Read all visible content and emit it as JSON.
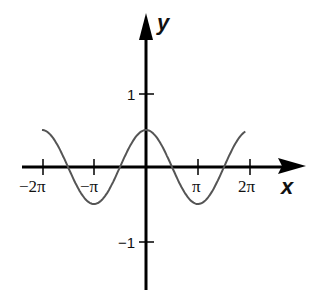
{
  "chart_data": {
    "type": "line",
    "title": "",
    "xlabel": "x",
    "ylabel": "y",
    "function": "y = 0.5·cos(x)",
    "x_ticks": [
      "−2π",
      "−π",
      "π",
      "2π"
    ],
    "x_tick_values": [
      -6.2832,
      -3.1416,
      3.1416,
      6.2832
    ],
    "y_ticks": [
      "1",
      "−1"
    ],
    "y_tick_values": [
      1,
      -1
    ],
    "xlim": [
      -6.2832,
      6.0
    ],
    "ylim": [
      -1.6,
      2.0
    ],
    "grid": false,
    "legend": null,
    "series": [
      {
        "name": "curve",
        "x": [
          -6.2832,
          -4.7124,
          -3.1416,
          -1.5708,
          0,
          1.5708,
          3.1416,
          4.7124,
          6.0
        ],
        "values": [
          0.5,
          0,
          -0.5,
          0,
          0.5,
          0,
          -0.5,
          0,
          0.48
        ]
      }
    ]
  },
  "labels": {
    "x_axis": "x",
    "y_axis": "y",
    "x_tick_neg2pi": "−2π",
    "x_tick_negpi": "−π",
    "x_tick_pi": "π",
    "x_tick_2pi": "2π",
    "y_tick_1": "1",
    "y_tick_neg1": "−1"
  },
  "colors": {
    "axis": "#000000",
    "curve": "#555555",
    "background": "#ffffff"
  }
}
